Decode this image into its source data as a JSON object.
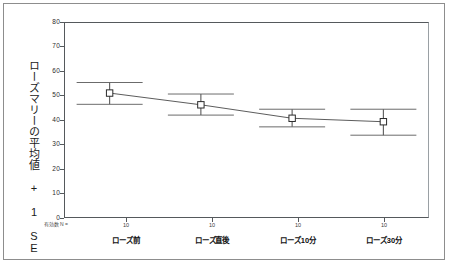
{
  "chart_data": {
    "type": "line",
    "title": "",
    "subtitle": "",
    "xlabel": "",
    "ylabel": "ローズマリーの平均値 + 1 SE",
    "categories": [
      "ローズ前",
      "ローズ直後",
      "ローズ10分",
      "ローズ30分"
    ],
    "values": [
      51.0,
      46.2,
      40.7,
      39.3
    ],
    "error_upper": [
      55.3,
      50.6,
      44.4,
      44.4
    ],
    "error_lower": [
      46.4,
      42.0,
      37.2,
      33.8
    ],
    "error_type": "1 SE",
    "counts": [
      10,
      10,
      10,
      10
    ],
    "counts_note": "有効数 N =",
    "ylim": [
      0,
      80
    ],
    "ytick_labels": [
      "80",
      "70",
      "60",
      "50",
      "40",
      "30",
      "20",
      "10",
      "0"
    ],
    "ytick_values": [
      80,
      70,
      60,
      50,
      40,
      30,
      20,
      10,
      0
    ],
    "grid": false,
    "legend": "none",
    "marker": "open-square",
    "series": [
      {
        "name": "ローズマリー平均値",
        "values": [
          51.0,
          46.2,
          40.7,
          39.3
        ]
      }
    ]
  },
  "axis": {
    "y_title": "ローズマリーの平均値 + 1 SE",
    "n_label": "有効数 N ="
  },
  "marks": {
    "line_color": "#4a4a4a",
    "marker_color": "#2a2a2a",
    "errorbar_color": "#5a5a5a",
    "axis_color": "#55595c",
    "frame_color": "#8d8d8d"
  }
}
